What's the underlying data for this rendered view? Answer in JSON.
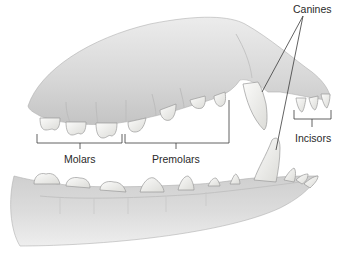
{
  "diagram": {
    "labels": {
      "canines": "Canines",
      "molars": "Molars",
      "premolars": "Premolars",
      "incisors": "Incisors"
    },
    "colors": {
      "background": "#ffffff",
      "gum": "#d9d9d9",
      "gum_shadow": "#b8b8b8",
      "tooth": "#f4f4f2",
      "tooth_edge": "#9a9a9a",
      "leader_line": "#3a3a3a",
      "text": "#2a2a2a"
    }
  }
}
